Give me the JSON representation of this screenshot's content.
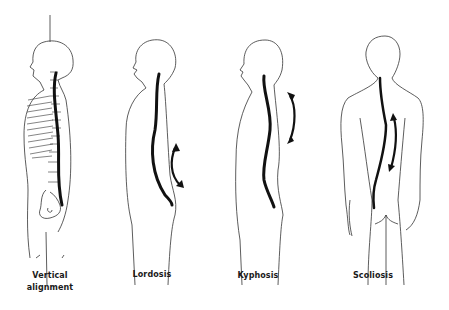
{
  "figure": {
    "panels": [
      {
        "id": "vertical",
        "label_line1": "Vertical",
        "label_line2": "alignment",
        "view": "side skeleton"
      },
      {
        "id": "lordosis",
        "label": "Lordosis",
        "view": "side silhouette"
      },
      {
        "id": "kyphosis",
        "label": "Kyphosis",
        "view": "side silhouette"
      },
      {
        "id": "scoliosis",
        "label": "Scoliosis",
        "view": "back silhouette"
      }
    ],
    "colors": {
      "outline": "#333333",
      "spine": "#111111",
      "background": "#ffffff"
    }
  }
}
